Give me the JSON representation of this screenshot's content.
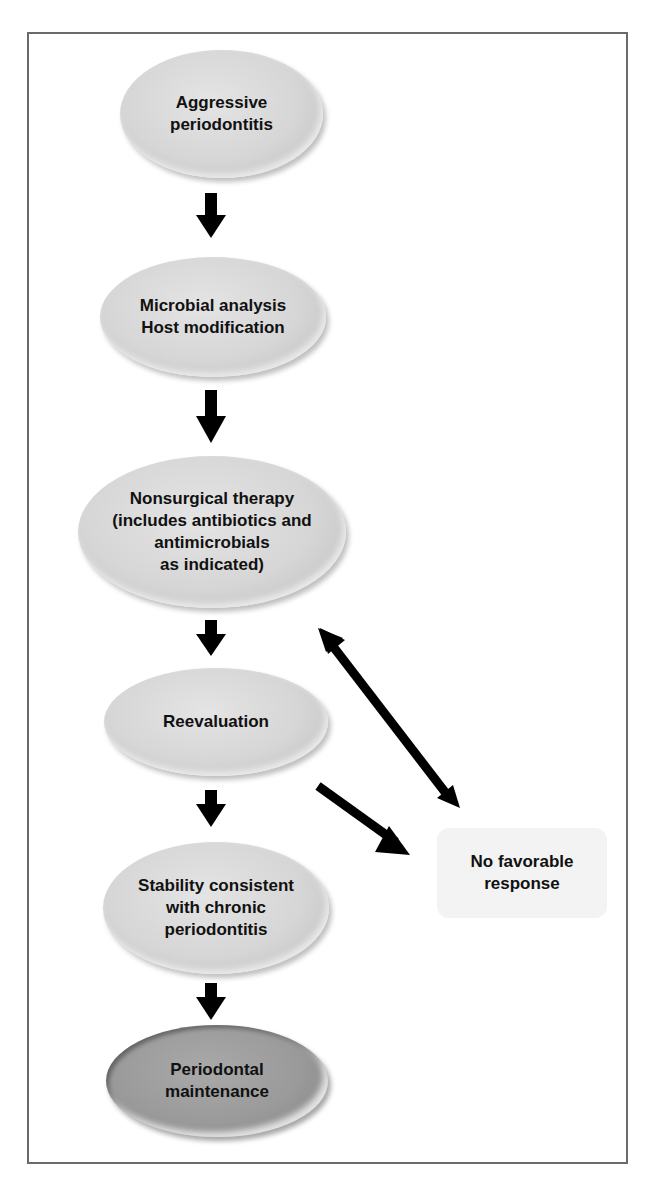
{
  "diagram": {
    "type": "flowchart",
    "nodes": [
      {
        "id": "aggressive",
        "label": "Aggressive\nperiodontitis"
      },
      {
        "id": "microbial",
        "label": "Microbial analysis\nHost modification"
      },
      {
        "id": "nonsurgical",
        "label": "Nonsurgical therapy\n(includes antibiotics and\nantimicrobials\nas indicated)"
      },
      {
        "id": "reevaluation",
        "label": "Reevaluation"
      },
      {
        "id": "stability",
        "label": "Stability consistent\nwith chronic\nperiodontitis"
      },
      {
        "id": "maintenance",
        "label": "Periodontal\nmaintenance"
      },
      {
        "id": "no_response",
        "label": "No favorable\nresponse"
      }
    ],
    "edges": [
      {
        "from": "aggressive",
        "to": "microbial"
      },
      {
        "from": "microbial",
        "to": "nonsurgical"
      },
      {
        "from": "nonsurgical",
        "to": "reevaluation"
      },
      {
        "from": "reevaluation",
        "to": "stability"
      },
      {
        "from": "reevaluation",
        "to": "no_response"
      },
      {
        "from": "no_response",
        "to": "nonsurgical",
        "bidirectional": true
      },
      {
        "from": "stability",
        "to": "maintenance"
      }
    ]
  }
}
